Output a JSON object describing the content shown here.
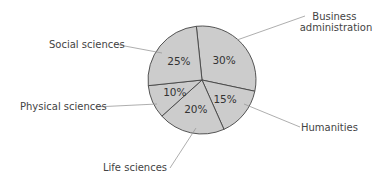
{
  "chart_data": {
    "type": "pie",
    "title": "",
    "colors": {
      "slice_fill": "#cccccc",
      "slice_stroke": "#444444",
      "leader": "#888888",
      "text": "#444444"
    },
    "slices": [
      {
        "label": "Business administration",
        "label_lines": [
          "Business",
          "administration"
        ],
        "value": 30,
        "value_label": "30%"
      },
      {
        "label": "Humanities",
        "label_lines": [
          "Humanities"
        ],
        "value": 15,
        "value_label": "15%"
      },
      {
        "label": "Life sciences",
        "label_lines": [
          "Life sciences"
        ],
        "value": 20,
        "value_label": "20%"
      },
      {
        "label": "Physical sciences",
        "label_lines": [
          "Physical sciences"
        ],
        "value": 10,
        "value_label": "10%"
      },
      {
        "label": "Social sciences",
        "label_lines": [
          "Social sciences"
        ],
        "value": 25,
        "value_label": "25%"
      }
    ]
  }
}
